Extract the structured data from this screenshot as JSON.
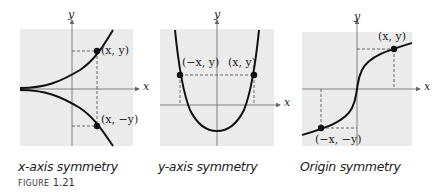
{
  "figure": {
    "label_prefix": "FIGURE",
    "label_number": "1.21"
  },
  "panels": [
    {
      "caption": "x-axis symmetry",
      "x_label": "x",
      "y_label": "y",
      "points": [
        "(x, y)",
        "(x, −y)"
      ]
    },
    {
      "caption": "y-axis symmetry",
      "x_label": "x",
      "y_label": "y",
      "points": [
        "(−x, y)",
        "(x, y)"
      ]
    },
    {
      "caption": "Origin symmetry",
      "x_label": "x",
      "y_label": "y",
      "points": [
        "(x, y)",
        "(−x, −y)"
      ]
    }
  ],
  "colors": {
    "panel_bg": "#ebebeb",
    "curve": "#111111",
    "axis": "#555555"
  }
}
